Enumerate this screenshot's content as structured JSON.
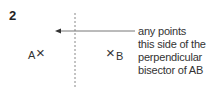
{
  "question_number": "2",
  "points": {
    "a": {
      "label": "A",
      "marker": "×"
    },
    "b": {
      "label": "B",
      "marker": "×"
    }
  },
  "annotation": {
    "lines": [
      "any points",
      "this side of the",
      "perpendicular",
      "bisector of AB"
    ]
  },
  "colors": {
    "line": "#888888",
    "text": "#333333"
  }
}
